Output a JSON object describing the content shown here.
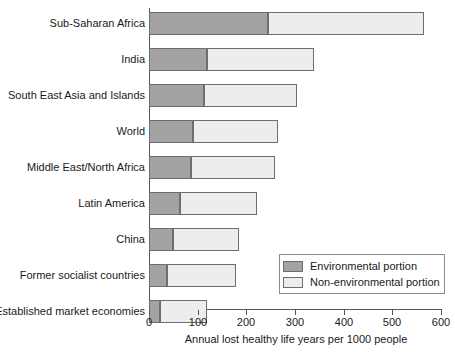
{
  "chart_data": {
    "type": "bar",
    "orientation": "horizontal",
    "stacked": true,
    "title": "",
    "xlabel": "Annual lost healthy life years per 1000 people",
    "ylabel": "",
    "xlim": [
      0,
      600
    ],
    "xticks": [
      0,
      100,
      200,
      300,
      400,
      500,
      600
    ],
    "xtick_labels": [
      "0",
      "100",
      "200",
      "300",
      "400",
      "500",
      "600"
    ],
    "grid": false,
    "legend_position": "lower-right",
    "categories": [
      "Sub-Saharan Africa",
      "India",
      "South East Asia and Islands",
      "World",
      "Middle East/North Africa",
      "Latin America",
      "China",
      "Former socialist countries",
      "Established market economies"
    ],
    "series": [
      {
        "name": "Environmental portion",
        "color": "#a3a3a3",
        "values": [
          245,
          120,
          113,
          90,
          87,
          63,
          49,
          38,
          23
        ]
      },
      {
        "name": "Non-environmental portion",
        "color": "#ededed",
        "values": [
          320,
          220,
          192,
          175,
          173,
          159,
          136,
          142,
          97
        ]
      }
    ],
    "totals": [
      565,
      340,
      305,
      265,
      260,
      222,
      185,
      180,
      120
    ]
  },
  "legend": {
    "items": [
      {
        "label": "Environmental portion",
        "swatch": "env"
      },
      {
        "label": "Non-environmental portion",
        "swatch": "nonenv"
      }
    ]
  },
  "colors": {
    "environmental": "#a3a3a3",
    "non_environmental": "#ededed",
    "outline": "#6e6e6e",
    "axis": "#555555",
    "text": "#1a1a1a"
  }
}
